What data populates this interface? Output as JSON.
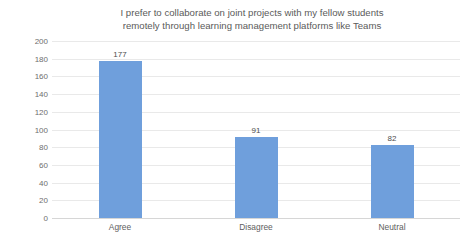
{
  "chart_data": {
    "type": "bar",
    "title": "I prefer to collaborate on joint projects with my fellow students remotely through learning management platforms like Teams",
    "title_lines": [
      "I prefer to collaborate on joint projects with my fellow students",
      "remotely through learning management platforms like Teams"
    ],
    "categories": [
      "Agree",
      "Disagree",
      "Neutral"
    ],
    "values": [
      177,
      91,
      82
    ],
    "xlabel": "",
    "ylabel": "",
    "ylim": [
      0,
      200
    ],
    "ytick_step": 20,
    "yticks": [
      "200",
      "180",
      "160",
      "140",
      "120",
      "100",
      "80",
      "60",
      "40",
      "20",
      "0"
    ],
    "grid": true,
    "legend": false,
    "bar_color": "#6f9fdc",
    "gridline_color": "#e9e9e9",
    "axis_color": "#d6d6d6",
    "title_color": "#5a5a5a",
    "tick_label_color": "#6e6e6e",
    "data_label_color": "#4d4d4d",
    "background_color": "#ffffff",
    "data_labels": [
      "177",
      "91",
      "82"
    ]
  }
}
